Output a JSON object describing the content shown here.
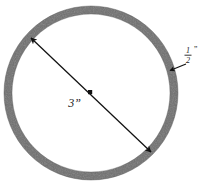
{
  "figure": {
    "background_color": "#ffffff",
    "ring": {
      "name": "annulus-ring",
      "fill_color": "#6e6e6e",
      "outline_color": "#5a5a5a",
      "center_x": 91,
      "center_y": 93,
      "outer_radius": 87,
      "stroke_width": 8
    },
    "dimensions": [
      {
        "id": "diameter",
        "label": "3",
        "unit_mark": "”",
        "full_label": "3”",
        "kind": "double-arrow",
        "from_x": 31,
        "from_y": 38,
        "to_x": 151,
        "to_y": 152,
        "label_x": 81,
        "label_y": 107,
        "arrow_color": "#111111"
      },
      {
        "id": "thickness",
        "numerator": "1",
        "denominator": "2",
        "unit_mark": "”",
        "full_label": "½”",
        "kind": "leader-arrow",
        "from_x": 192,
        "from_y": 62,
        "to_x": 171,
        "to_y": 70,
        "label_x": 186,
        "label_y": 55,
        "arrow_color": "#111111"
      }
    ]
  }
}
